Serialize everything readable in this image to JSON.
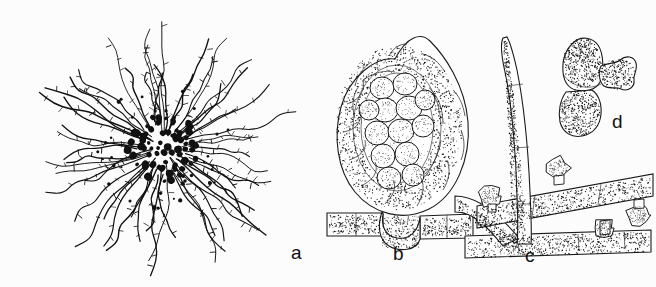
{
  "figure": {
    "background_color": "#fcfcfc",
    "ink_color": "#111111",
    "width": 656,
    "height": 287,
    "panel_count": 4
  },
  "panels": [
    {
      "id": "a",
      "label": "a",
      "label_x": 291,
      "label_y": 243,
      "subject": "radiating-mycelial-colony-with-dark-central-fruiting-bodies",
      "center_x": 163,
      "center_y": 148,
      "colony_radius": 140,
      "core_radius": 36,
      "hypha_count": 58,
      "cleistothecium_dot_count": 78
    },
    {
      "id": "b",
      "label": "b",
      "label_x": 393,
      "label_y": 244,
      "subject": "cleistothecium-section-with-asci-on-hypha",
      "center_x": 396,
      "center_y": 128,
      "body_width": 118,
      "body_height": 152,
      "ascus_count": 13
    },
    {
      "id": "c",
      "label": "c",
      "label_x": 525,
      "label_y": 246,
      "subject": "hyphae-with-erect-seta-and-lobed-appressoria",
      "seta_base_x": 515,
      "seta_base_y": 240,
      "seta_tip_x": 523,
      "seta_tip_y": 38,
      "appressorium_count": 4
    },
    {
      "id": "d",
      "label": "d",
      "label_x": 612,
      "label_y": 112,
      "subject": "two-celled-germling-with-lobed-appressorium",
      "center_x": 582,
      "center_y": 70,
      "cell_count": 2
    }
  ],
  "labels": {
    "a": "a",
    "b": "b",
    "c": "c",
    "d": "d"
  }
}
